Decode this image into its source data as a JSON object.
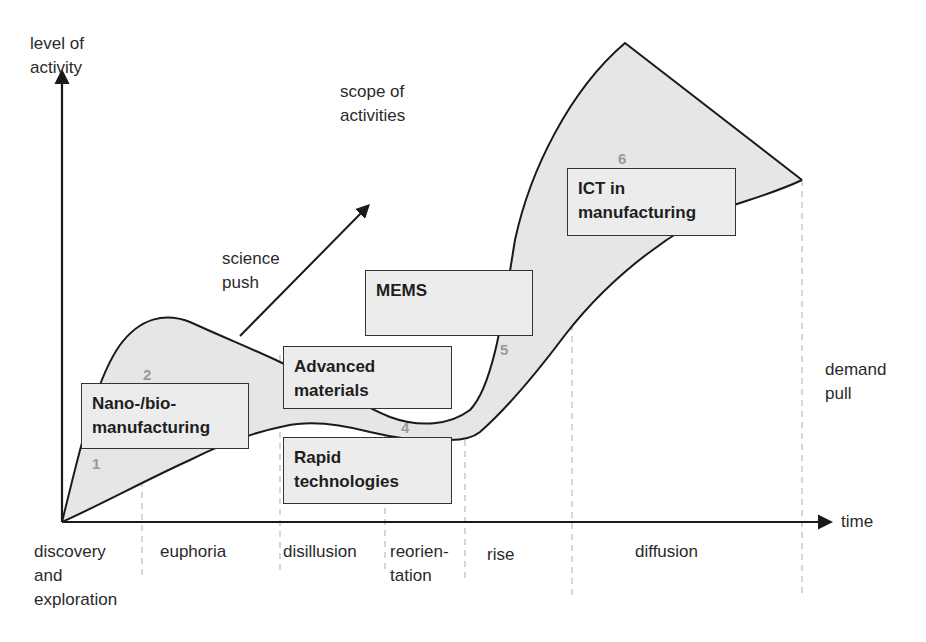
{
  "diagram": {
    "type": "technology hype / lifecycle diagram",
    "axes": {
      "y_label": "level of\nactivity",
      "x_label": "time",
      "diagonal_label": "scope of\nactivities",
      "diagonal_side_label": "science\npush",
      "right_side_label": "demand\npull"
    },
    "phases": [
      {
        "id": 1,
        "label": "discovery\nand\nexploration"
      },
      {
        "id": 2,
        "label": "euphoria"
      },
      {
        "id": 3,
        "label": "disillusion"
      },
      {
        "id": 4,
        "label": "reorien-\ntation"
      },
      {
        "id": 5,
        "label": "rise"
      },
      {
        "id": 6,
        "label": "diffusion"
      }
    ],
    "boxes": [
      {
        "label": "Nano-/bio-\nmanufacturing"
      },
      {
        "label": "Advanced\nmaterials"
      },
      {
        "label": "Rapid\ntechnologies"
      },
      {
        "label": "MEMS"
      },
      {
        "label": "ICT in\nmanufacturing"
      }
    ],
    "markers": [
      "1",
      "2",
      "4",
      "5",
      "6"
    ],
    "colors": {
      "band_fill": "#e6e6e6",
      "line": "#1a1a1a",
      "box_fill": "#ececec",
      "marker": "#9a9a9a",
      "dashed": "#bbbbbb"
    }
  }
}
